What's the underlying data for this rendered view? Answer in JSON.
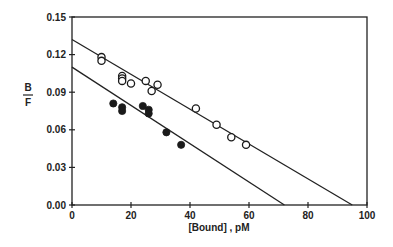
{
  "chart_data": {
    "type": "scatter",
    "title": "",
    "xlabel": "[Bound] , pM",
    "ylabel_numerator": "B",
    "ylabel_denominator": "F",
    "xlim": [
      0,
      100
    ],
    "ylim": [
      0,
      0.15
    ],
    "x_ticks": [
      "0",
      "20",
      "40",
      "60",
      "80",
      "100"
    ],
    "y_ticks": [
      "0.00",
      "0.03",
      "0.06",
      "0.09",
      "0.12",
      "0.15"
    ],
    "grid": false,
    "legend": null,
    "series": [
      {
        "name": "open circles",
        "marker": "open-circle",
        "points": [
          [
            10,
            0.118
          ],
          [
            10,
            0.115
          ],
          [
            17,
            0.103
          ],
          [
            17,
            0.101
          ],
          [
            17,
            0.099
          ],
          [
            20,
            0.097
          ],
          [
            25,
            0.099
          ],
          [
            27,
            0.091
          ],
          [
            29,
            0.096
          ],
          [
            42,
            0.077
          ],
          [
            49,
            0.064
          ],
          [
            54,
            0.054
          ],
          [
            59,
            0.048
          ]
        ],
        "fit_line": {
          "x0": 0,
          "y0": 0.132,
          "x1": 95,
          "y1": 0.0
        }
      },
      {
        "name": "filled circles",
        "marker": "filled-circle",
        "points": [
          [
            14,
            0.081
          ],
          [
            17,
            0.078
          ],
          [
            17,
            0.075
          ],
          [
            24,
            0.079
          ],
          [
            26,
            0.076
          ],
          [
            26,
            0.073
          ],
          [
            32,
            0.058
          ],
          [
            37,
            0.048
          ]
        ],
        "fit_line": {
          "x0": 0,
          "y0": 0.11,
          "x1": 72,
          "y1": 0.0
        }
      }
    ]
  }
}
